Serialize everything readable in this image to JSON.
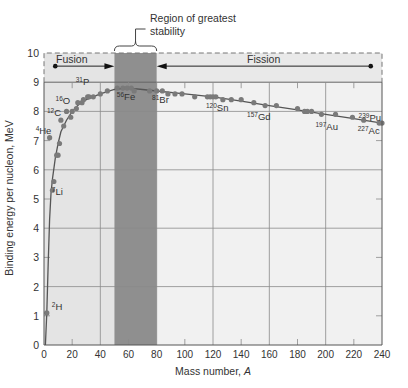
{
  "chart_data": {
    "type": "scatter",
    "title": "",
    "xlabel": "Mass number, A",
    "ylabel": "Binding energy per nucleon, MeV",
    "xlim": [
      0,
      240
    ],
    "ylim": [
      0,
      10
    ],
    "xticks": [
      0,
      20,
      40,
      60,
      80,
      100,
      120,
      140,
      160,
      180,
      200,
      220,
      240
    ],
    "yticks": [
      0,
      1,
      2,
      3,
      4,
      5,
      6,
      7,
      8,
      9,
      10
    ],
    "grid": true,
    "annotations": {
      "region_label": "Region of greatest stability",
      "region_range": [
        50,
        80
      ],
      "fusion_label": "Fusion",
      "fission_label": "Fission",
      "fusion_arrow": [
        8,
        50
      ],
      "fission_arrow": [
        232,
        80
      ]
    },
    "labeled_points": [
      {
        "label": "2H",
        "mass": "2",
        "symbol": "H",
        "x": 2,
        "y": 1.1
      },
      {
        "label": "4He",
        "mass": "4",
        "symbol": "He",
        "x": 4,
        "y": 7.1
      },
      {
        "label": "7Li",
        "mass": "7",
        "symbol": "Li",
        "x": 7,
        "y": 5.6
      },
      {
        "label": "12C",
        "mass": "12",
        "symbol": "C",
        "x": 12,
        "y": 7.7
      },
      {
        "label": "16O",
        "mass": "16",
        "symbol": "O",
        "x": 16,
        "y": 8.0
      },
      {
        "label": "31P",
        "mass": "31",
        "symbol": "P",
        "x": 31,
        "y": 8.5
      },
      {
        "label": "56Fe",
        "mass": "56",
        "symbol": "Fe",
        "x": 56,
        "y": 8.8
      },
      {
        "label": "81Br",
        "mass": "81",
        "symbol": "Br",
        "x": 81,
        "y": 8.7
      },
      {
        "label": "120Sn",
        "mass": "120",
        "symbol": "Sn",
        "x": 120,
        "y": 8.5
      },
      {
        "label": "157Gd",
        "mass": "157",
        "symbol": "Gd",
        "x": 157,
        "y": 8.2
      },
      {
        "label": "197Au",
        "mass": "197",
        "symbol": "Au",
        "x": 197,
        "y": 7.9
      },
      {
        "label": "227Ac",
        "mass": "227",
        "symbol": "Ac",
        "x": 227,
        "y": 7.7
      },
      {
        "label": "239Pu",
        "mass": "239",
        "symbol": "Pu",
        "x": 239,
        "y": 7.6
      }
    ],
    "series": [
      {
        "name": "measured nuclides",
        "x": [
          2,
          4,
          6,
          7,
          9,
          10,
          11,
          12,
          14,
          16,
          19,
          20,
          23,
          24,
          27,
          28,
          31,
          32,
          35,
          40,
          45,
          52,
          56,
          59,
          62,
          64,
          75,
          80,
          84,
          88,
          93,
          98,
          107,
          116,
          118,
          120,
          122,
          127,
          133,
          140,
          149,
          157,
          165,
          180,
          185,
          187,
          190,
          197,
          207,
          219,
          227,
          238,
          240
        ],
        "y": [
          1.1,
          7.1,
          5.3,
          5.6,
          6.5,
          6.5,
          6.9,
          7.7,
          7.5,
          8.0,
          7.8,
          8.0,
          8.1,
          8.3,
          8.3,
          8.4,
          8.5,
          8.5,
          8.5,
          8.6,
          8.7,
          8.8,
          8.8,
          8.8,
          8.8,
          8.7,
          8.7,
          8.7,
          8.7,
          8.6,
          8.6,
          8.6,
          8.5,
          8.5,
          8.5,
          8.5,
          8.5,
          8.4,
          8.4,
          8.4,
          8.3,
          8.2,
          8.2,
          8.1,
          8.0,
          8.0,
          8.0,
          7.9,
          7.9,
          7.8,
          7.7,
          7.6,
          7.6
        ]
      },
      {
        "name": "trend curve",
        "x": [
          1,
          2,
          3,
          4,
          5,
          6,
          8,
          10,
          12,
          16,
          20,
          25,
          30,
          40,
          50,
          56,
          62,
          70,
          80,
          100,
          120,
          140,
          160,
          180,
          200,
          220,
          240
        ],
        "y": [
          0,
          1.1,
          2.8,
          4.3,
          5.2,
          5.7,
          6.4,
          6.9,
          7.3,
          7.7,
          8.0,
          8.25,
          8.4,
          8.6,
          8.75,
          8.79,
          8.79,
          8.75,
          8.7,
          8.6,
          8.5,
          8.35,
          8.2,
          8.05,
          7.9,
          7.75,
          7.6
        ]
      }
    ]
  },
  "figure": {
    "region_label_line1": "Region of greatest",
    "region_label_line2": "stability",
    "fusion_label": "Fusion",
    "fission_label": "Fission",
    "xlabel": "Mass number, ",
    "xlabel_var": "A",
    "ylabel": "Binding energy per nucleon, MeV",
    "colors": {
      "light_band": "#e4e4e4",
      "stable_band": "#8f8f8f",
      "plot_bg": "#f1f1f1",
      "grid": "#8a8a8a",
      "points": "#7a7a7a",
      "curve": "#555555"
    }
  }
}
